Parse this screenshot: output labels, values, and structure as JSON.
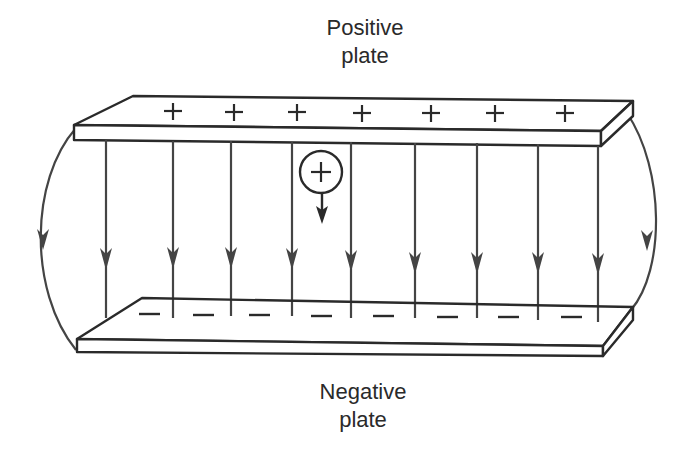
{
  "labels": {
    "positive_line1": "Positive",
    "positive_line2": "plate",
    "negative_line1": "Negative",
    "negative_line2": "plate"
  },
  "symbols": {
    "plus": "+",
    "minus": "–",
    "charge": "+"
  },
  "colors": {
    "ink": "#2a2a2a",
    "field_line": "#444444",
    "background": "#ffffff"
  },
  "diagram": {
    "top_plate_charges": 7,
    "bottom_plate_charges": 8,
    "interior_field_lines": 9,
    "fringe_field_lines": 2
  }
}
